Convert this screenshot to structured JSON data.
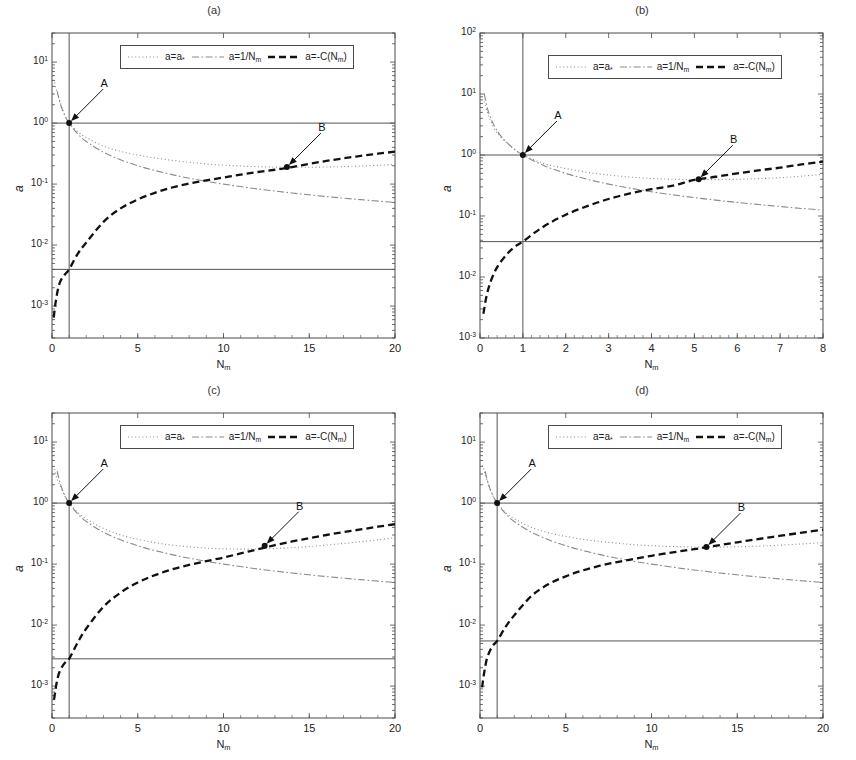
{
  "figure": {
    "axis_label_y": "a",
    "axis_label_x": "N_m",
    "xlabel_main": "N",
    "xlabel_sub": "m"
  },
  "legend": {
    "entries": [
      {
        "key": "a-star",
        "label_pre": "a=a",
        "label_sub": "*",
        "label_post": "",
        "style": "dotted",
        "color": "#8a8a8a"
      },
      {
        "key": "inv-nm",
        "label_pre": "a=1/N",
        "label_sub": "m",
        "label_post": "",
        "style": "dashdot",
        "color": "#8a8a8a"
      },
      {
        "key": "minus-c",
        "label_pre": "a=-C(N",
        "label_sub": "m",
        "label_post": ")",
        "style": "dashed",
        "color": "#111111"
      }
    ]
  },
  "panels": [
    {
      "id": "a",
      "title": "(a)",
      "xticks": [
        "0",
        "5",
        "10",
        "15",
        "20"
      ],
      "yticks": [
        "10<sup>1</sup>",
        "10<sup>0</sup>",
        "10<sup>-1</sup>",
        "10<sup>-2</sup>",
        "10<sup>-3</sup>"
      ],
      "annotations": [
        {
          "text": "A",
          "point": "(1, 1)"
        },
        {
          "text": "B",
          "point": "(13.7, 0.19)"
        }
      ]
    },
    {
      "id": "b",
      "title": "(b)",
      "xticks": [
        "0",
        "1",
        "2",
        "3",
        "4",
        "5",
        "6",
        "7",
        "8"
      ],
      "yticks": [
        "10<sup>2</sup>",
        "10<sup>1</sup>",
        "10<sup>0</sup>",
        "10<sup>-1</sup>",
        "10<sup>-2</sup>",
        "10<sup>-3</sup>"
      ],
      "annotations": [
        {
          "text": "A",
          "point": "(1, 1)"
        },
        {
          "text": "B",
          "point": "(5.1, 0.40)"
        }
      ]
    },
    {
      "id": "c",
      "title": "(c)",
      "xticks": [
        "0",
        "5",
        "10",
        "15",
        "20"
      ],
      "yticks": [
        "10<sup>1</sup>",
        "10<sup>0</sup>",
        "10<sup>-1</sup>",
        "10<sup>-2</sup>",
        "10<sup>-3</sup>"
      ],
      "annotations": [
        {
          "text": "A",
          "point": "(1, 1)"
        },
        {
          "text": "B",
          "point": "(12.4, 0.20)"
        }
      ]
    },
    {
      "id": "d",
      "title": "(d)",
      "xticks": [
        "0",
        "5",
        "10",
        "15",
        "20"
      ],
      "yticks": [
        "10<sup>1</sup>",
        "10<sup>0</sup>",
        "10<sup>-1</sup>",
        "10<sup>-2</sup>",
        "10<sup>-3</sup>"
      ],
      "annotations": [
        {
          "text": "A",
          "point": "(1, 1)"
        },
        {
          "text": "B",
          "point": "(13.2, 0.19)"
        }
      ]
    }
  ],
  "chart_data": [
    {
      "type": "line",
      "panel": "a",
      "title": "(a)",
      "xlabel": "N_m",
      "ylabel": "a",
      "xscale": "linear",
      "yscale": "log",
      "xlim": [
        0,
        20
      ],
      "ylim": [
        0.0003,
        30
      ],
      "grid": false,
      "legend_position": "top-center",
      "reference_lines": {
        "horizontal": [
          1.0,
          0.004
        ],
        "vertical": [
          1.0
        ]
      },
      "markers": [
        {
          "label": "A",
          "x": 1.0,
          "y": 1.0
        },
        {
          "label": "B",
          "x": 13.7,
          "y": 0.19
        }
      ],
      "series": [
        {
          "name": "a=a*",
          "style": "dotted",
          "color": "#8a8a8a",
          "x": [
            0.15,
            0.3,
            0.5,
            0.75,
            1.0,
            1.5,
            2,
            3,
            4,
            5,
            6,
            7,
            8,
            9,
            10,
            11,
            12,
            13,
            14,
            15,
            16,
            17,
            18,
            19,
            20
          ],
          "y": [
            4.6,
            3.2,
            2.1,
            1.35,
            1.0,
            0.72,
            0.58,
            0.42,
            0.345,
            0.3,
            0.268,
            0.245,
            0.228,
            0.214,
            0.205,
            0.198,
            0.193,
            0.19,
            0.189,
            0.189,
            0.191,
            0.194,
            0.198,
            0.203,
            0.21
          ]
        },
        {
          "name": "a=1/Nm",
          "style": "dashdot",
          "color": "#8a8a8a",
          "x": [
            0.3,
            0.5,
            0.75,
            1.0,
            1.5,
            2,
            3,
            4,
            5,
            6,
            7,
            8,
            9,
            10,
            12,
            14,
            16,
            18,
            20
          ],
          "y": [
            3.33,
            2.0,
            1.333,
            1.0,
            0.667,
            0.5,
            0.333,
            0.25,
            0.2,
            0.167,
            0.143,
            0.125,
            0.111,
            0.1,
            0.0833,
            0.0714,
            0.0625,
            0.0556,
            0.05
          ]
        },
        {
          "name": "a=-C(Nm)",
          "style": "dashed",
          "color": "#111111",
          "x": [
            0.1,
            0.2,
            0.35,
            0.5,
            0.75,
            1.0,
            1.5,
            2,
            3,
            4,
            5,
            6,
            7,
            8,
            9,
            10,
            11,
            12,
            13,
            14,
            15,
            16,
            17,
            18,
            19,
            20
          ],
          "y": [
            0.00065,
            0.0011,
            0.0019,
            0.0026,
            0.0033,
            0.004,
            0.0072,
            0.011,
            0.024,
            0.04,
            0.056,
            0.072,
            0.088,
            0.102,
            0.115,
            0.128,
            0.143,
            0.158,
            0.172,
            0.19,
            0.215,
            0.24,
            0.265,
            0.29,
            0.315,
            0.34
          ]
        }
      ]
    },
    {
      "type": "line",
      "panel": "b",
      "title": "(b)",
      "xlabel": "N_m",
      "ylabel": "a",
      "xscale": "linear",
      "yscale": "log",
      "xlim": [
        0,
        8
      ],
      "ylim": [
        0.001,
        100
      ],
      "grid": false,
      "legend_position": "top-center",
      "reference_lines": {
        "horizontal": [
          1.0,
          0.038
        ],
        "vertical": [
          1.0
        ]
      },
      "markers": [
        {
          "label": "A",
          "x": 1.0,
          "y": 1.0
        },
        {
          "label": "B",
          "x": 5.1,
          "y": 0.4
        }
      ],
      "series": [
        {
          "name": "a=a*",
          "style": "dotted",
          "color": "#8a8a8a",
          "x": [
            0.1,
            0.2,
            0.35,
            0.5,
            0.75,
            1.0,
            1.5,
            2,
            2.5,
            3,
            3.5,
            4,
            4.5,
            5,
            5.5,
            6,
            6.5,
            7,
            7.5,
            8
          ],
          "y": [
            7.5,
            4.4,
            2.6,
            1.9,
            1.33,
            1.0,
            0.72,
            0.6,
            0.52,
            0.47,
            0.435,
            0.412,
            0.4,
            0.395,
            0.395,
            0.4,
            0.41,
            0.425,
            0.45,
            0.48
          ]
        },
        {
          "name": "a=1/Nm",
          "style": "dashdot",
          "color": "#8a8a8a",
          "x": [
            0.1,
            0.2,
            0.35,
            0.5,
            0.75,
            1.0,
            1.5,
            2,
            2.5,
            3,
            3.5,
            4,
            4.5,
            5,
            5.5,
            6,
            6.5,
            7,
            7.5,
            8
          ],
          "y": [
            10.0,
            5.0,
            2.857,
            2.0,
            1.333,
            1.0,
            0.667,
            0.5,
            0.4,
            0.333,
            0.286,
            0.25,
            0.222,
            0.2,
            0.182,
            0.167,
            0.154,
            0.143,
            0.133,
            0.125
          ]
        },
        {
          "name": "a=-C(Nm)",
          "style": "dashed",
          "color": "#111111",
          "x": [
            0.08,
            0.15,
            0.25,
            0.4,
            0.6,
            0.8,
            1.0,
            1.3,
            1.6,
            2,
            2.5,
            3,
            3.5,
            4,
            4.5,
            5,
            5.5,
            6,
            6.5,
            7,
            7.5,
            8
          ],
          "y": [
            0.0025,
            0.0048,
            0.0085,
            0.0145,
            0.0225,
            0.031,
            0.038,
            0.055,
            0.075,
            0.105,
            0.145,
            0.19,
            0.235,
            0.275,
            0.315,
            0.39,
            0.44,
            0.5,
            0.56,
            0.62,
            0.7,
            0.78
          ]
        }
      ]
    },
    {
      "type": "line",
      "panel": "c",
      "title": "(c)",
      "xlabel": "N_m",
      "ylabel": "a",
      "xscale": "linear",
      "yscale": "log",
      "xlim": [
        0,
        20
      ],
      "ylim": [
        0.0003,
        30
      ],
      "grid": false,
      "legend_position": "top-center",
      "reference_lines": {
        "horizontal": [
          1.0,
          0.0028
        ],
        "vertical": [
          1.0
        ]
      },
      "markers": [
        {
          "label": "A",
          "x": 1.0,
          "y": 1.0
        },
        {
          "label": "B",
          "x": 12.4,
          "y": 0.2
        }
      ],
      "series": [
        {
          "name": "a=a*",
          "style": "dotted",
          "color": "#8a8a8a",
          "x": [
            0.15,
            0.3,
            0.5,
            0.75,
            1.0,
            1.5,
            2,
            3,
            4,
            5,
            6,
            7,
            8,
            9,
            10,
            11,
            12,
            13,
            14,
            15,
            16,
            17,
            18,
            19,
            20
          ],
          "y": [
            3.6,
            2.5,
            1.85,
            1.3,
            1.0,
            0.7,
            0.55,
            0.385,
            0.3,
            0.255,
            0.225,
            0.205,
            0.192,
            0.183,
            0.178,
            0.176,
            0.177,
            0.18,
            0.186,
            0.194,
            0.205,
            0.218,
            0.233,
            0.25,
            0.27
          ]
        },
        {
          "name": "a=1/Nm",
          "style": "dashdot",
          "color": "#8a8a8a",
          "x": [
            0.3,
            0.5,
            0.75,
            1.0,
            1.5,
            2,
            3,
            4,
            5,
            6,
            7,
            8,
            9,
            10,
            12,
            14,
            16,
            18,
            20
          ],
          "y": [
            3.33,
            2.0,
            1.333,
            1.0,
            0.667,
            0.5,
            0.333,
            0.25,
            0.2,
            0.167,
            0.143,
            0.125,
            0.111,
            0.1,
            0.0833,
            0.0714,
            0.0625,
            0.0556,
            0.05
          ]
        },
        {
          "name": "a=-C(Nm)",
          "style": "dashed",
          "color": "#111111",
          "x": [
            0.12,
            0.25,
            0.4,
            0.6,
            0.8,
            1.0,
            1.5,
            2,
            3,
            4,
            5,
            6,
            7,
            8,
            9,
            10,
            11,
            12,
            13,
            14,
            15,
            16,
            17,
            18,
            19,
            20
          ],
          "y": [
            0.0006,
            0.00105,
            0.0016,
            0.0021,
            0.0025,
            0.0028,
            0.0052,
            0.0088,
            0.02,
            0.034,
            0.05,
            0.066,
            0.082,
            0.097,
            0.112,
            0.128,
            0.15,
            0.175,
            0.205,
            0.235,
            0.265,
            0.3,
            0.335,
            0.37,
            0.41,
            0.45
          ]
        }
      ]
    },
    {
      "type": "line",
      "panel": "d",
      "title": "(d)",
      "xlabel": "N_m",
      "ylabel": "a",
      "xscale": "linear",
      "yscale": "log",
      "xlim": [
        0,
        20
      ],
      "ylim": [
        0.0003,
        30
      ],
      "grid": false,
      "legend_position": "top-center",
      "reference_lines": {
        "horizontal": [
          1.0,
          0.0055
        ],
        "vertical": [
          1.0
        ]
      },
      "markers": [
        {
          "label": "A",
          "x": 1.0,
          "y": 1.0
        },
        {
          "label": "B",
          "x": 13.2,
          "y": 0.19
        }
      ],
      "series": [
        {
          "name": "a=a*",
          "style": "dotted",
          "color": "#8a8a8a",
          "x": [
            0.15,
            0.3,
            0.5,
            0.75,
            1.0,
            1.5,
            2,
            3,
            4,
            5,
            6,
            7,
            8,
            9,
            10,
            11,
            12,
            13,
            14,
            15,
            16,
            17,
            18,
            19,
            20
          ],
          "y": [
            4.2,
            3.0,
            2.0,
            1.33,
            1.0,
            0.7,
            0.555,
            0.4,
            0.325,
            0.285,
            0.255,
            0.235,
            0.22,
            0.208,
            0.2,
            0.195,
            0.192,
            0.19,
            0.19,
            0.192,
            0.196,
            0.201,
            0.208,
            0.216,
            0.225
          ]
        },
        {
          "name": "a=1/Nm",
          "style": "dashdot",
          "color": "#8a8a8a",
          "x": [
            0.3,
            0.5,
            0.75,
            1.0,
            1.5,
            2,
            3,
            4,
            5,
            6,
            7,
            8,
            9,
            10,
            12,
            14,
            16,
            18,
            20
          ],
          "y": [
            3.33,
            2.0,
            1.333,
            1.0,
            0.667,
            0.5,
            0.333,
            0.25,
            0.2,
            0.167,
            0.143,
            0.125,
            0.111,
            0.1,
            0.0833,
            0.0714,
            0.0625,
            0.0556,
            0.05
          ]
        },
        {
          "name": "a=-C(Nm)",
          "style": "dashed",
          "color": "#111111",
          "x": [
            0.12,
            0.25,
            0.4,
            0.6,
            0.8,
            1.0,
            1.5,
            2,
            3,
            4,
            5,
            6,
            7,
            8,
            9,
            10,
            11,
            12,
            13,
            14,
            15,
            16,
            17,
            18,
            19,
            20
          ],
          "y": [
            0.00095,
            0.0017,
            0.0028,
            0.0039,
            0.0048,
            0.0055,
            0.0094,
            0.0145,
            0.03,
            0.047,
            0.063,
            0.079,
            0.094,
            0.108,
            0.122,
            0.137,
            0.152,
            0.168,
            0.185,
            0.205,
            0.228,
            0.252,
            0.278,
            0.305,
            0.335,
            0.365
          ]
        }
      ]
    }
  ]
}
